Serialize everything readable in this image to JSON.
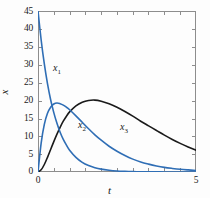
{
  "figure": {
    "background": "#fdfdfd",
    "frame_color": "#8d8d8d"
  },
  "axes": {
    "xlabel": "t",
    "ylabel": "x",
    "x_ticks_labeled": [
      "0",
      "5"
    ],
    "y_ticks_labeled": [
      "0",
      "5",
      "10",
      "15",
      "20",
      "25",
      "30",
      "35",
      "40",
      "45"
    ],
    "xlim": [
      0,
      5
    ],
    "ylim": [
      0,
      45
    ],
    "x_minor_tick_count": 10,
    "grid": false
  },
  "annotations": [
    {
      "name": "curve-label-x1",
      "base": "x",
      "sub": "1",
      "left": 53,
      "top": 63
    },
    {
      "name": "curve-label-x2",
      "base": "x",
      "sub": "2",
      "left": 78,
      "top": 120
    },
    {
      "name": "curve-label-x3",
      "base": "x",
      "sub": "3",
      "left": 120,
      "top": 122
    }
  ],
  "chart_data": {
    "type": "line",
    "title": "",
    "xlabel": "t",
    "ylabel": "x",
    "xlim": [
      0,
      5
    ],
    "ylim": [
      0,
      45
    ],
    "grid": false,
    "legend_position": "inline-curve-labels",
    "x": [
      0,
      0.1,
      0.2,
      0.3,
      0.4,
      0.5,
      0.6,
      0.7,
      0.8,
      0.9,
      1.0,
      1.2,
      1.4,
      1.6,
      1.8,
      2.0,
      2.25,
      2.5,
      2.75,
      3.0,
      3.25,
      3.5,
      3.75,
      4.0,
      4.25,
      4.5,
      4.75,
      5.0
    ],
    "series": [
      {
        "name": "x1",
        "label": "x₁",
        "color": "#2f6eb5",
        "linewidth": 1.6,
        "values": [
          45.0,
          36.9,
          30.2,
          24.7,
          20.2,
          16.6,
          13.6,
          11.1,
          9.1,
          7.5,
          6.1,
          4.1,
          2.7,
          1.8,
          1.2,
          0.8,
          0.5,
          0.3,
          0.19,
          0.11,
          0.07,
          0.04,
          0.03,
          0.02,
          0.01,
          0.01,
          0.0,
          0.0
        ]
      },
      {
        "name": "x2",
        "label": "x₂",
        "color": "#2f6eb5",
        "linewidth": 1.6,
        "values": [
          0.0,
          8.1,
          13.3,
          16.4,
          18.1,
          19.0,
          19.3,
          19.1,
          18.7,
          18.1,
          17.4,
          15.7,
          13.9,
          12.1,
          10.4,
          8.9,
          7.2,
          5.8,
          4.6,
          3.6,
          2.8,
          2.2,
          1.7,
          1.3,
          1.0,
          0.75,
          0.58,
          0.44
        ]
      },
      {
        "name": "x3",
        "label": "x₃",
        "color": "#1a1a1a",
        "linewidth": 1.6,
        "values": [
          0.0,
          0.6,
          2.1,
          4.1,
          6.3,
          8.5,
          10.6,
          12.5,
          14.2,
          15.6,
          16.8,
          18.5,
          19.5,
          20.0,
          20.1,
          19.8,
          19.1,
          18.1,
          16.9,
          15.6,
          14.2,
          12.9,
          11.6,
          10.3,
          9.1,
          8.0,
          7.0,
          6.1
        ]
      }
    ]
  }
}
